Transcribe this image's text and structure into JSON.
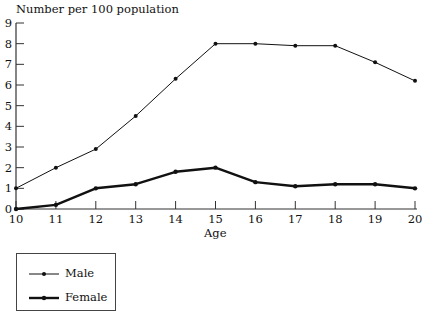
{
  "chart_data": {
    "type": "line",
    "title": "",
    "ylabel": "Number per 100 population",
    "xlabel": "Age",
    "x": [
      10,
      11,
      12,
      13,
      14,
      15,
      16,
      17,
      18,
      19,
      20
    ],
    "xticks": [
      "10",
      "11",
      "12",
      "13",
      "14",
      "15",
      "16",
      "17",
      "18",
      "19",
      "20"
    ],
    "yticks": [
      "0",
      "1",
      "2",
      "3",
      "4",
      "5",
      "6",
      "7",
      "8",
      "9"
    ],
    "ylim": [
      0,
      9
    ],
    "xlim": [
      10,
      20
    ],
    "grid": false,
    "legend_position": "bottom-left, below axis",
    "series": [
      {
        "name": "Male",
        "line_width": "thin",
        "marker": "dot",
        "values": [
          1.0,
          2.0,
          2.9,
          4.5,
          6.3,
          8.0,
          8.0,
          7.9,
          7.9,
          7.1,
          6.2
        ]
      },
      {
        "name": "Female",
        "line_width": "thick",
        "marker": "dot",
        "values": [
          0.0,
          0.2,
          1.0,
          1.2,
          1.8,
          2.0,
          1.3,
          1.1,
          1.2,
          1.2,
          1.0
        ]
      }
    ]
  },
  "legend": {
    "items": [
      {
        "label": "Male"
      },
      {
        "label": "Female"
      }
    ]
  },
  "colors": {
    "line": "#111111",
    "axis": "#333333",
    "background": "#ffffff"
  }
}
